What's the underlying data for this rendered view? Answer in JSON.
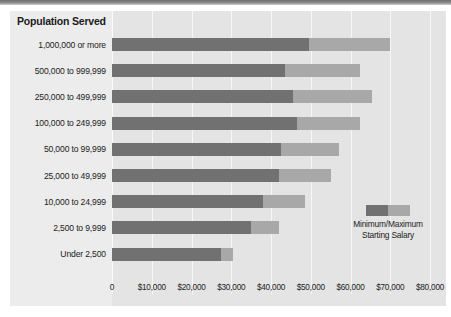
{
  "chart_data": {
    "type": "bar",
    "orientation": "horizontal",
    "title": "Population Served",
    "xlabel": "",
    "ylabel": "Population Served",
    "xlim": [
      0,
      80000
    ],
    "xticks": [
      0,
      10000,
      20000,
      30000,
      40000,
      50000,
      60000,
      70000,
      80000
    ],
    "xtick_labels": [
      "0",
      "$10,000",
      "$20,000",
      "$30,000",
      "$40,000",
      "$50,000",
      "$60,000",
      "$70,000",
      "$80,000"
    ],
    "grid": true,
    "legend_position": "inside-right",
    "legend_label_line1": "Minimum/Maximum",
    "legend_label_line2": "Starting Salary",
    "categories": [
      "1,000,000 or more",
      "500,000 to 999,999",
      "250,000 to 499,999",
      "100,000 to 249,999",
      "50,000 to 99,999",
      "25,000 to 49,999",
      "10,000 to 24,999",
      "2,500 to 9,999",
      "Under 2,500"
    ],
    "series": [
      {
        "name": "Minimum Starting Salary",
        "color": "#717171",
        "values": [
          49500,
          43500,
          45500,
          46500,
          42500,
          42000,
          38000,
          35000,
          27500
        ]
      },
      {
        "name": "Maximum Starting Salary",
        "color": "#a8a8a8",
        "values": [
          70000,
          62500,
          65500,
          62500,
          57000,
          55000,
          48500,
          42000,
          30500
        ]
      }
    ],
    "colors": {
      "minimum": "#717171",
      "maximum": "#a8a8a8",
      "plot_background": "#e4e4e4",
      "panel_background": "#e9e9e9",
      "gridline": "#f7f7f7",
      "text": "#232323"
    }
  }
}
